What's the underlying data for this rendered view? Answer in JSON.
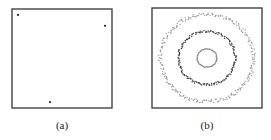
{
  "panels": [
    {
      "id": "a",
      "caption": "(a)",
      "description": "Three isolated points in a square domain",
      "points": [
        [
          0.06,
          0.06
        ],
        [
          0.93,
          0.17
        ],
        [
          0.38,
          0.94
        ]
      ]
    },
    {
      "id": "b",
      "caption": "(b)",
      "description": "Three concentric noisy rings",
      "rings": [
        {
          "name": "outer",
          "radius": 0.95,
          "color": "#9a9a9a",
          "count": 260
        },
        {
          "name": "middle",
          "radius": 0.58,
          "color": "#333333",
          "count": 170
        },
        {
          "name": "inner",
          "radius": 0.2,
          "color": "#888888",
          "count": 70
        }
      ]
    }
  ]
}
